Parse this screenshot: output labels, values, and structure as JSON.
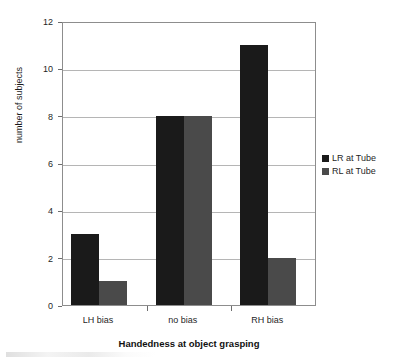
{
  "chart_data": {
    "type": "bar",
    "title": "",
    "subtitle": "",
    "xlabel": "Handedness at object grasping",
    "ylabel": "number of subjects",
    "categories": [
      "LH bias",
      "no bias",
      "RH bias"
    ],
    "series": [
      {
        "name": "LR at Tube",
        "values": [
          3,
          8,
          11
        ],
        "color": "#1a1a1a"
      },
      {
        "name": "RL at Tube",
        "values": [
          1,
          8,
          2
        ],
        "color": "#4a4a4a"
      }
    ],
    "ylim": [
      0,
      12
    ],
    "ytick_labels": [
      "12",
      "10",
      "8",
      "6",
      "4",
      "2",
      "0"
    ],
    "ytick_values": [
      12,
      10,
      8,
      6,
      4,
      2,
      0
    ],
    "grid": "horizontal",
    "legend_position": "right",
    "bar_group_layout": "clustered"
  },
  "axes": {
    "y_title": "number of subjects",
    "x_title": "Handedness at object grasping"
  },
  "legend": {
    "entries": [
      {
        "label": "LR at Tube",
        "color": "#1a1a1a"
      },
      {
        "label": "RL at Tube",
        "color": "#4a4a4a"
      }
    ]
  },
  "colors": {
    "series_1": "#1a1a1a",
    "series_2": "#4a4a4a",
    "gridline": "#b5b5b5",
    "frame": "#8d8d8d",
    "text": "#1f1f1f",
    "background": "#ffffff"
  }
}
